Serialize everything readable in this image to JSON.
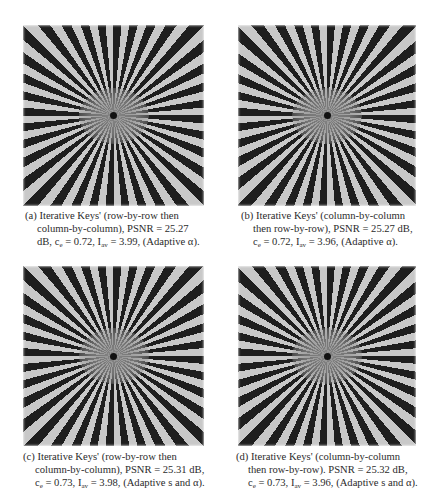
{
  "figure": {
    "panels": [
      {
        "id": "a",
        "image": "siemens-star-reconstruction",
        "caption": {
          "line1": "(a) Iterative Keys' (row-by-row then",
          "line2": "column-by-column), PSNR = 25.27",
          "line3_pre": "dB, c",
          "line3_sub1": "e",
          "line3_mid": " = 0.72,  I",
          "line3_sub2": "av",
          "line3_post": " = 3.99,  (Adaptive α)."
        },
        "metrics": {
          "psnr_db": 25.27,
          "c_e": 0.72,
          "I_av": 3.99,
          "adaptive": "α",
          "order": "row-by-row then column-by-column"
        }
      },
      {
        "id": "b",
        "image": "siemens-star-reconstruction",
        "caption": {
          "line1": "(b) Iterative Keys' (column-by-column",
          "line2": "then row-by-row), PSNR = 25.27 dB,",
          "line3_pre": "c",
          "line3_sub1": "e",
          "line3_mid": " = 0.72,  I",
          "line3_sub2": "av",
          "line3_post": " = 3.96, (Adaptive α)."
        },
        "metrics": {
          "psnr_db": 25.27,
          "c_e": 0.72,
          "I_av": 3.96,
          "adaptive": "α",
          "order": "column-by-column then row-by-row"
        }
      },
      {
        "id": "c",
        "image": "siemens-star-reconstruction",
        "caption": {
          "line1": "(c) Iterative Keys' (row-by-row then",
          "line2": "column-by-column), PSNR = 25.31 dB,",
          "line3_pre": "c",
          "line3_sub1": "e",
          "line3_mid": " = 0.73,  I",
          "line3_sub2": "av",
          "line3_post": " = 3.98, (Adaptive s and α)."
        },
        "metrics": {
          "psnr_db": 25.31,
          "c_e": 0.73,
          "I_av": 3.98,
          "adaptive": "s and α",
          "order": "row-by-row then column-by-column"
        }
      },
      {
        "id": "d",
        "image": "siemens-star-reconstruction",
        "caption": {
          "line1": "(d) Iterative Keys' (column-by-column",
          "line2": "then row-by-row). PSNR = 25.32 dB,",
          "line3_pre": "c",
          "line3_sub1": "e",
          "line3_mid": " = 0.73,  I",
          "line3_sub2": "av",
          "line3_post": " = 3.96, (Adaptive s and α)."
        },
        "metrics": {
          "psnr_db": 25.32,
          "c_e": 0.73,
          "I_av": 3.96,
          "adaptive": "s and α",
          "order": "column-by-column then row-by-row"
        }
      }
    ]
  }
}
